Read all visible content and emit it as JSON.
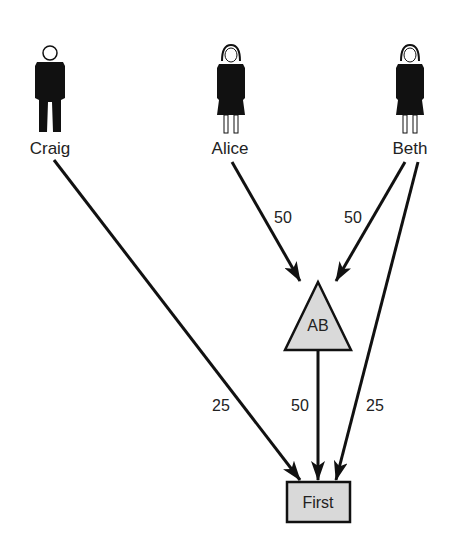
{
  "diagram": {
    "people": [
      {
        "name": "Craig",
        "gender": "male",
        "x": 50
      },
      {
        "name": "Alice",
        "gender": "female",
        "x": 230
      },
      {
        "name": "Beth",
        "gender": "female",
        "x": 408
      }
    ],
    "nodes": {
      "group": {
        "label": "AB",
        "shape": "triangle",
        "fill": "#d9d9d9"
      },
      "target": {
        "label": "First",
        "shape": "rectangle",
        "fill": "#d9d9d9"
      }
    },
    "edges": [
      {
        "from": "Alice",
        "to": "AB",
        "weight": "50"
      },
      {
        "from": "Beth",
        "to": "AB",
        "weight": "50"
      },
      {
        "from": "Craig",
        "to": "First",
        "weight": "25"
      },
      {
        "from": "AB",
        "to": "First",
        "weight": "50"
      },
      {
        "from": "Beth",
        "to": "First",
        "weight": "25"
      }
    ],
    "colors": {
      "line": "#111111",
      "node_fill": "#d9d9d9",
      "text": "#222222"
    }
  }
}
